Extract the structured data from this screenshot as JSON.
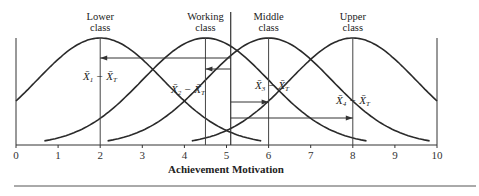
{
  "chart_data": {
    "type": "line",
    "title": "",
    "xlabel": "Achievement Motivation",
    "ylabel": "",
    "xlim": [
      0,
      10
    ],
    "x_ticks": [
      0,
      1,
      2,
      3,
      4,
      5,
      6,
      7,
      8,
      9,
      10
    ],
    "x_tick_labels": [
      "0",
      "1",
      "2",
      "3",
      "4",
      "5",
      "6",
      "7",
      "8",
      "9",
      "10"
    ],
    "grid": false,
    "legend": "none (group labels above peaks)",
    "grand_mean": 5.1,
    "series": [
      {
        "name": "Lower class",
        "label_line1": "Lower",
        "label_line2": "class",
        "mean": 2.0,
        "sd": 1.5,
        "annotation": "X̄1 − X̄T",
        "sub": "1"
      },
      {
        "name": "Working class",
        "label_line1": "Working",
        "label_line2": "class",
        "mean": 4.5,
        "sd": 1.5,
        "annotation": "X̄2 − X̄T",
        "sub": "2"
      },
      {
        "name": "Middle class",
        "label_line1": "Middle",
        "label_line2": "class",
        "mean": 6.0,
        "sd": 1.5,
        "annotation": "X̄3 − X̄T",
        "sub": "3"
      },
      {
        "name": "Upper class",
        "label_line1": "Upper",
        "label_line2": "class",
        "mean": 8.0,
        "sd": 1.5,
        "annotation": "X̄4 − X̄T",
        "sub": "4"
      }
    ],
    "annotations": [
      "Arrows from grand mean (X̄T ≈ 5.1) to each group mean, representing deviation X̄j − X̄T"
    ]
  }
}
